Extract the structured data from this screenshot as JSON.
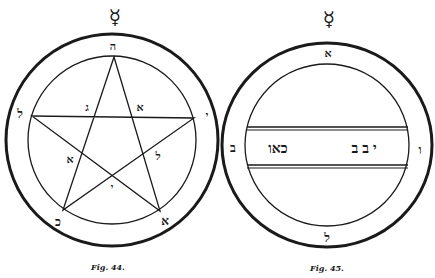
{
  "colors": {
    "ink": "#1a1a1a",
    "paper": "#ffffff"
  },
  "figure44": {
    "symbol_icon": "mercury-symbol",
    "symbol_glyph": "☿",
    "caption": "Fig. 44.",
    "outer_ring_letters": {
      "top": "ה",
      "left": "ל",
      "right": "י",
      "bottom_left": "כ",
      "bottom_right": "א"
    },
    "star_letters": {
      "upper_left": "ג",
      "upper_right": "א",
      "lower_left": "א",
      "lower_right": "ל",
      "center": "י"
    }
  },
  "figure45": {
    "symbol_icon": "mercury-symbol",
    "symbol_glyph": "☿",
    "caption": "Fig. 45.",
    "ring_letters": {
      "top": "א",
      "left": "ב",
      "right": "ו",
      "bottom": "ל"
    },
    "band_text": {
      "left_word": "כאו",
      "right_word": "יבב"
    }
  }
}
